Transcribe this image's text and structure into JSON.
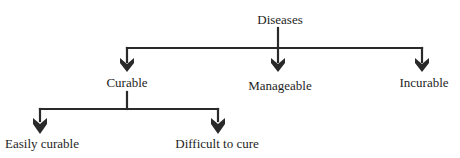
{
  "diagram": {
    "type": "tree",
    "colors": {
      "line": "#2a2a2a",
      "text": "#1e1e1e",
      "background": "#ffffff"
    },
    "root": {
      "label": "Diseases",
      "children": [
        {
          "label": "Curable",
          "children": [
            {
              "label": "Easily curable"
            },
            {
              "label": "Difficult to cure"
            }
          ]
        },
        {
          "label": "Manageable"
        },
        {
          "label": "Incurable"
        }
      ]
    },
    "nodes": {
      "diseases": "Diseases",
      "curable": "Curable",
      "manageable": "Manageable",
      "incurable": "Incurable",
      "easily_curable": "Easily curable",
      "difficult_to_cure": "Difficult to cure"
    }
  }
}
